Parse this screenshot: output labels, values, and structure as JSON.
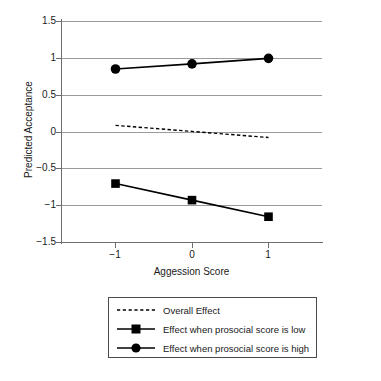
{
  "chart_data": {
    "type": "line",
    "title": "",
    "subtitle": "",
    "xlabel": "Aggession Score",
    "ylabel": "Predicted Acceptance",
    "x": [
      -1,
      0,
      1
    ],
    "xlim": [
      -1.5,
      1.5
    ],
    "ylim": [
      -1.5,
      1.5
    ],
    "xticks": [
      -1,
      0,
      1
    ],
    "xtick_labels": [
      "−1",
      "0",
      "1"
    ],
    "yticks": [
      -1.5,
      -1,
      -0.5,
      0,
      0.5,
      1,
      1.5
    ],
    "ytick_labels": [
      "−1.5",
      "−1",
      "−0.5",
      "0",
      "0.5",
      "1",
      "1.5"
    ],
    "grid": "horizontal",
    "legend_position": "below-plot",
    "series": [
      {
        "name": "Overall Effect",
        "key": "overall-effect",
        "values": [
          0.09,
          0.008,
          -0.075
        ],
        "marker": "none",
        "linestyle": "dashed",
        "color": "#000000"
      },
      {
        "name": "Effect when prosocial score is low",
        "key": "prosocial-low",
        "values": [
          -0.7,
          -0.925,
          -1.15
        ],
        "marker": "square",
        "linestyle": "solid",
        "color": "#000000"
      },
      {
        "name": "Effect when prosocial score is high",
        "key": "prosocial-high",
        "values": [
          0.855,
          0.925,
          1.0
        ],
        "marker": "circle",
        "linestyle": "solid",
        "color": "#000000"
      }
    ]
  },
  "axes": {
    "ylabel": "Predicted Acceptance",
    "xlabel": "Aggession Score",
    "ytick_labels": [
      "1.5",
      "1",
      "0.5",
      "0",
      "−0.5",
      "−1",
      "−1.5"
    ],
    "xtick_labels": [
      "−1",
      "0",
      "1"
    ]
  },
  "legend": {
    "items": [
      {
        "label": "Overall Effect",
        "marker": "dashed-line",
        "name": "overall-effect"
      },
      {
        "label": "Effect when prosocial score is low",
        "marker": "square-line",
        "name": "prosocial-low"
      },
      {
        "label": "Effect when prosocial score is high",
        "marker": "circle-line",
        "name": "prosocial-high"
      }
    ]
  },
  "colors": {
    "series": "#000000",
    "grid": "#9a9a9a",
    "axis": "#6e6e6e",
    "text": "#1a1a1a",
    "legend_border": "#4a4a4a",
    "background": "#ffffff"
  }
}
